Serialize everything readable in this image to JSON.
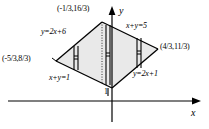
{
  "figure": {
    "name": "region-between-lines-diagram",
    "background": "#ffffff",
    "ink": "#000000",
    "fill": "#e8e8e8"
  },
  "axes": {
    "x_label": "x",
    "y_label": "y",
    "x_tick_label": "1",
    "x_axis_y": 101,
    "y_axis_x": 112
  },
  "vertices": [
    {
      "name": "top-vertex",
      "label": "(-1/3,16/3)",
      "x": 102,
      "y": 22
    },
    {
      "name": "left-vertex",
      "label": "(-5/3,8/3)",
      "x": 56,
      "y": 61
    },
    {
      "name": "right-vertex",
      "label": "(4/3,11/3)",
      "x": 158,
      "y": 49
    },
    {
      "name": "bottom-vertex",
      "label": "",
      "x": 112,
      "y": 88
    }
  ],
  "lines": [
    {
      "name": "line-y-2x-plus-6",
      "label": "y=2x+6",
      "side": "upper-left"
    },
    {
      "name": "line-x-plus-y-5",
      "label": "x+y=5",
      "side": "upper-right"
    },
    {
      "name": "line-x-plus-y-1",
      "label": "x+y=1",
      "side": "lower-left"
    },
    {
      "name": "line-y-2x-plus-1",
      "label": "y=2x+1",
      "side": "lower-right"
    }
  ],
  "strips": [
    {
      "name": "strip-left",
      "x": 74
    },
    {
      "name": "strip-middle",
      "x": 106
    },
    {
      "name": "strip-right",
      "x": 137
    }
  ]
}
